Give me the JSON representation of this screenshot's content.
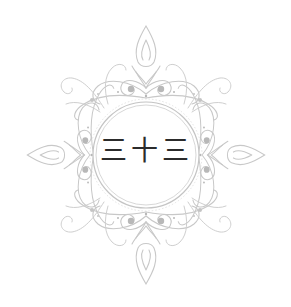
{
  "emblem": {
    "text": "三十三",
    "meaning": "thirty-three"
  },
  "colors": {
    "background": "#ffffff",
    "ornament_stroke": "#c8c8c8",
    "ornament_dots": "#b8b8b8",
    "ring_stroke": "#bdbdbd",
    "text": "#2b2b2b"
  }
}
